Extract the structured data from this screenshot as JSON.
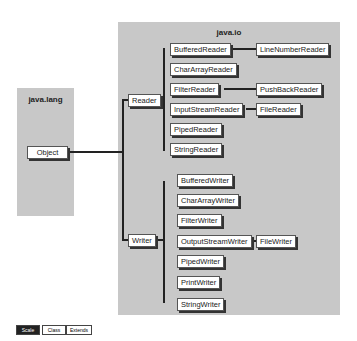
{
  "packages": {
    "lang": "java.lang",
    "io": "java.io"
  },
  "root": "Object",
  "reader": {
    "label": "Reader",
    "children": [
      "BufferedReader",
      "CharArrayReader",
      "FilterReader",
      "InputStreamReader",
      "PipedReader",
      "StringReader"
    ],
    "sub": {
      "BufferedReader": "LineNumberReader",
      "FilterReader": "PushBackReader",
      "InputStreamReader": "FileReader"
    }
  },
  "writer": {
    "label": "Writer",
    "children": [
      "BufferedWriter",
      "CharArrayWriter",
      "FilterWriter",
      "OutputStreamWriter",
      "PipedWriter",
      "PrintWriter",
      "StringWriter"
    ],
    "sub": {
      "OutputStreamWriter": "FileWriter"
    }
  },
  "legend": [
    "Scale",
    "Class",
    "Extends"
  ]
}
